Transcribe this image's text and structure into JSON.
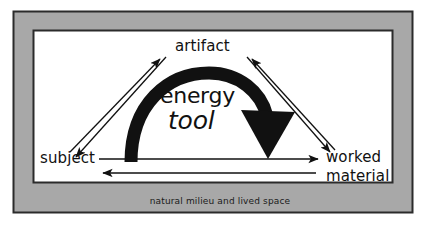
{
  "figure": {
    "type": "concept-diagram",
    "caption": "natural milieu and lived space",
    "nodes": [
      {
        "id": "artifact",
        "label": "artifact",
        "position": "top-center"
      },
      {
        "id": "subject",
        "label": "subject",
        "position": "bottom-left"
      },
      {
        "id": "worked-material",
        "label_line1": "worked",
        "label_line2": "material",
        "position": "bottom-right"
      }
    ],
    "center_labels": [
      {
        "id": "energy",
        "text": "energy",
        "style": "upright"
      },
      {
        "id": "tool",
        "text": "tool",
        "style": "italic"
      }
    ],
    "edges": [
      {
        "id": "subject-to-artifact",
        "from": "subject",
        "to": "artifact",
        "style": "thin-arrow"
      },
      {
        "id": "artifact-to-subject",
        "from": "artifact",
        "to": "subject",
        "style": "thin-arrow"
      },
      {
        "id": "worked-material-to-artifact",
        "from": "worked-material",
        "to": "artifact",
        "style": "thin-arrow"
      },
      {
        "id": "artifact-to-worked-material",
        "from": "artifact",
        "to": "worked-material",
        "style": "thin-arrow"
      },
      {
        "id": "subject-to-worked-material",
        "from": "subject",
        "to": "worked-material",
        "style": "thin-arrow"
      },
      {
        "id": "worked-material-to-subject",
        "from": "worked-material",
        "to": "subject",
        "style": "thin-arrow"
      },
      {
        "id": "energy-tool-arc",
        "from": "subject",
        "to": "worked-material",
        "via": "artifact",
        "style": "thick-curved-arrow"
      }
    ]
  },
  "colors": {
    "frame_gray": "#a8a8a8",
    "ink": "#111111",
    "canvas": "#ffffff",
    "outline": "#2b2b2b"
  }
}
